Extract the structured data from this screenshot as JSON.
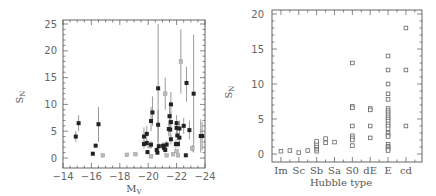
{
  "chart_data": [
    {
      "type": "scatter",
      "title": "",
      "xlabel": "M_V",
      "ylabel": "S_N",
      "xlim": [
        -14,
        -24
      ],
      "ylim": [
        0,
        25
      ],
      "xticks": [
        -14,
        -16,
        -18,
        -20,
        -22,
        -24
      ],
      "xtick_labels": [
        "−14",
        "−16",
        "−18",
        "−20",
        "−22",
        "−24"
      ],
      "yticks": [
        0,
        5,
        10,
        15,
        20,
        25
      ],
      "grid": false,
      "series": [
        {
          "name": "filled (with error bars)",
          "marker": "filled-square",
          "points": [
            {
              "x": -14.9,
              "y": 4.0,
              "lo": 3.0,
              "hi": 5.0
            },
            {
              "x": -15.1,
              "y": 6.5,
              "lo": 5.0,
              "hi": 8.0
            },
            {
              "x": -16.1,
              "y": 0.8,
              "lo": 0.5,
              "hi": 1.1
            },
            {
              "x": -16.3,
              "y": 2.3,
              "lo": 2.0,
              "hi": 2.6
            },
            {
              "x": -16.5,
              "y": 6.3,
              "lo": 3.0,
              "hi": 9.5
            },
            {
              "x": -19.7,
              "y": 4.0,
              "lo": 2.5,
              "hi": 5.7
            },
            {
              "x": -19.7,
              "y": 2.6,
              "lo": 1.8,
              "hi": 3.4
            },
            {
              "x": -19.9,
              "y": 4.5,
              "lo": 3.0,
              "hi": 6.0
            },
            {
              "x": -19.9,
              "y": 2.8,
              "lo": 2.2,
              "hi": 3.4
            },
            {
              "x": -19.95,
              "y": 1.1,
              "lo": 0.7,
              "hi": 1.5
            },
            {
              "x": -20.2,
              "y": 6.9,
              "lo": 5.0,
              "hi": 9.5
            },
            {
              "x": -20.3,
              "y": 8.5,
              "lo": 6.0,
              "hi": 11.5
            },
            {
              "x": -20.2,
              "y": 2.5,
              "lo": 1.8,
              "hi": 3.2
            },
            {
              "x": -20.6,
              "y": 1.5,
              "lo": 1.0,
              "hi": 2.0
            },
            {
              "x": -20.65,
              "y": 1.0,
              "lo": 0.6,
              "hi": 1.4
            },
            {
              "x": -20.7,
              "y": 13.0,
              "lo": 2.0,
              "hi": 25.0
            },
            {
              "x": -20.7,
              "y": 6.2,
              "lo": 3.0,
              "hi": 9.0
            },
            {
              "x": -20.75,
              "y": 2.2,
              "lo": 1.6,
              "hi": 2.8
            },
            {
              "x": -21.05,
              "y": 2.3,
              "lo": 1.5,
              "hi": 3.0
            },
            {
              "x": -21.1,
              "y": 1.9,
              "lo": 1.3,
              "hi": 2.5
            },
            {
              "x": -21.2,
              "y": 1.5,
              "lo": 1.0,
              "hi": 2.0
            },
            {
              "x": -21.3,
              "y": 2.5,
              "lo": 1.8,
              "hi": 3.2
            },
            {
              "x": -21.45,
              "y": 5.4,
              "lo": 4.0,
              "hi": 7.0
            },
            {
              "x": -21.5,
              "y": 7.8,
              "lo": 6.0,
              "hi": 9.5
            },
            {
              "x": -21.6,
              "y": 10.0,
              "lo": 7.5,
              "hi": 12.3
            },
            {
              "x": -21.6,
              "y": 6.7,
              "lo": 5.0,
              "hi": 8.5
            },
            {
              "x": -21.55,
              "y": 5.3,
              "lo": 4.0,
              "hi": 6.5
            },
            {
              "x": -21.6,
              "y": 3.5,
              "lo": 2.5,
              "hi": 4.5
            },
            {
              "x": -21.95,
              "y": 2.6,
              "lo": 1.8,
              "hi": 3.4
            },
            {
              "x": -22.0,
              "y": 6.5,
              "lo": 5.0,
              "hi": 8.0
            },
            {
              "x": -22.0,
              "y": 5.6,
              "lo": 4.5,
              "hi": 6.8
            },
            {
              "x": -22.05,
              "y": 4.2,
              "lo": 3.3,
              "hi": 5.2
            },
            {
              "x": -22.1,
              "y": 2.6,
              "lo": 2.0,
              "hi": 3.2
            },
            {
              "x": -22.2,
              "y": 5.5,
              "lo": 4.0,
              "hi": 7.0
            },
            {
              "x": -22.2,
              "y": 3.8,
              "lo": 2.8,
              "hi": 4.8
            },
            {
              "x": -22.5,
              "y": 6.0,
              "lo": 4.5,
              "hi": 7.5
            },
            {
              "x": -22.7,
              "y": 14.0,
              "lo": 10.5,
              "hi": 17.0
            },
            {
              "x": -22.65,
              "y": 0.5,
              "lo": 0.3,
              "hi": 0.7
            },
            {
              "x": -22.9,
              "y": 5.2,
              "lo": 3.5,
              "hi": 7.0
            },
            {
              "x": -23.2,
              "y": 12.0,
              "lo": 1.0,
              "hi": 23.0
            },
            {
              "x": -23.7,
              "y": 4.1,
              "lo": 1.0,
              "hi": 7.2
            },
            {
              "x": -23.8,
              "y": 4.1,
              "lo": 1.5,
              "hi": 6.7
            }
          ]
        },
        {
          "name": "open (gray)",
          "marker": "open-square",
          "points": [
            {
              "x": -16.8,
              "y": 0.5
            },
            {
              "x": -18.5,
              "y": 0.6,
              "lo": 0.3,
              "hi": 0.9
            },
            {
              "x": -19.1,
              "y": 0.7,
              "lo": 0.4,
              "hi": 1.0
            },
            {
              "x": -20.2,
              "y": 0.3
            },
            {
              "x": -20.1,
              "y": 2.2
            },
            {
              "x": -21.2,
              "y": 12.0,
              "lo": 9.0,
              "hi": 15.0
            },
            {
              "x": -21.3,
              "y": 0.5
            },
            {
              "x": -21.75,
              "y": 0.7
            },
            {
              "x": -22.0,
              "y": 1.3
            },
            {
              "x": -22.1,
              "y": 0.5
            },
            {
              "x": -22.3,
              "y": 18.0,
              "lo": 12.0,
              "hi": 24.0
            },
            {
              "x": -23.1,
              "y": 1.8,
              "lo": 1.2,
              "hi": 2.4
            }
          ]
        }
      ]
    },
    {
      "type": "scatter",
      "title": "",
      "xlabel": "Hubble type",
      "ylabel": "S_N",
      "ylim": [
        0,
        20
      ],
      "yticks": [
        0,
        5,
        10,
        15,
        20
      ],
      "categories": [
        "Im",
        "Sc",
        "Sb",
        "Sa",
        "S0",
        "dE",
        "E",
        "cd"
      ],
      "grid": false,
      "series": [
        {
          "name": "open squares",
          "marker": "open-square",
          "points": [
            {
              "x": 0.5,
              "y": 0.4
            },
            {
              "x": 1.0,
              "y": 0.5
            },
            {
              "x": 1.5,
              "y": 0.2
            },
            {
              "x": 2.0,
              "y": 0.5
            },
            {
              "x": 2.5,
              "y": 0.4
            },
            {
              "x": 2.5,
              "y": 0.7
            },
            {
              "x": 2.5,
              "y": 1.0
            },
            {
              "x": 2.5,
              "y": 1.2
            },
            {
              "x": 2.5,
              "y": 1.5
            },
            {
              "x": 2.5,
              "y": 1.8
            },
            {
              "x": 3.0,
              "y": 1.6
            },
            {
              "x": 3.0,
              "y": 2.2
            },
            {
              "x": 3.5,
              "y": 1.7
            },
            {
              "x": 4.5,
              "y": 13.0
            },
            {
              "x": 4.5,
              "y": 6.8
            },
            {
              "x": 4.5,
              "y": 6.6
            },
            {
              "x": 4.5,
              "y": 4.0
            },
            {
              "x": 4.5,
              "y": 2.6
            },
            {
              "x": 4.5,
              "y": 2.3
            },
            {
              "x": 4.5,
              "y": 2.0
            },
            {
              "x": 4.5,
              "y": 1.2
            },
            {
              "x": 5.5,
              "y": 6.5
            },
            {
              "x": 5.5,
              "y": 6.3
            },
            {
              "x": 5.5,
              "y": 4.0
            },
            {
              "x": 5.5,
              "y": 2.3
            },
            {
              "x": 6.5,
              "y": 14.0
            },
            {
              "x": 6.5,
              "y": 12.0
            },
            {
              "x": 6.5,
              "y": 10.0
            },
            {
              "x": 6.5,
              "y": 8.6
            },
            {
              "x": 6.5,
              "y": 7.8
            },
            {
              "x": 6.5,
              "y": 6.5
            },
            {
              "x": 6.5,
              "y": 6.2
            },
            {
              "x": 6.5,
              "y": 5.9
            },
            {
              "x": 6.5,
              "y": 5.6
            },
            {
              "x": 6.5,
              "y": 5.3
            },
            {
              "x": 6.5,
              "y": 5.0
            },
            {
              "x": 6.5,
              "y": 4.7
            },
            {
              "x": 6.5,
              "y": 4.3
            },
            {
              "x": 6.5,
              "y": 4.0
            },
            {
              "x": 6.5,
              "y": 3.6
            },
            {
              "x": 6.5,
              "y": 3.0
            },
            {
              "x": 6.5,
              "y": 2.7
            },
            {
              "x": 6.5,
              "y": 2.5
            },
            {
              "x": 6.5,
              "y": 1.4
            },
            {
              "x": 6.5,
              "y": 1.1
            },
            {
              "x": 6.5,
              "y": 0.9
            },
            {
              "x": 6.5,
              "y": 0.7
            },
            {
              "x": 6.5,
              "y": 0.5
            },
            {
              "x": 7.5,
              "y": 18.0
            },
            {
              "x": 7.5,
              "y": 12.0
            },
            {
              "x": 7.5,
              "y": 4.0
            }
          ]
        }
      ],
      "category_positions": [
        0.5,
        1.5,
        2.5,
        3.5,
        4.5,
        5.5,
        6.5,
        7.5
      ]
    }
  ],
  "left_chart": {
    "ylabel_main": "S",
    "ylabel_sub": "N",
    "xlabel_main": "M",
    "xlabel_sub": "V"
  },
  "right_chart": {
    "ylabel_main": "S",
    "ylabel_sub": "N",
    "xlabel": "Hubble type"
  }
}
